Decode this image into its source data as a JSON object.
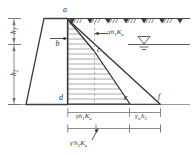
{
  "figure": {
    "type": "engineering-diagram",
    "points": {
      "a": "a",
      "b": "b",
      "c": "c",
      "d": "d",
      "e": "e",
      "f": "f"
    },
    "dimensions": {
      "h1": "h",
      "h1_sub": "1",
      "h2": "h",
      "h2_sub": "2"
    },
    "labels": {
      "active_pressure_top": {
        "gamma": "γ",
        "h": "h",
        "h_sub": "1",
        "K": "K",
        "K_sub": "a"
      },
      "active_pressure_bottom": {
        "gamma": "γ",
        "h": "h",
        "h_sub": "1",
        "K": "K",
        "K_sub": "a"
      },
      "water_pressure": {
        "gamma": "γ",
        "gamma_sub": "w",
        "h": "h",
        "h_sub": "2"
      },
      "submerged_pressure": {
        "gamma": "γ′",
        "h": "h",
        "h_sub": "2",
        "K": "K",
        "K_sub": "a"
      }
    },
    "symbols": {
      "ground_surface": "ground-hatch-icon",
      "water_table": "water-table-icon"
    },
    "colors": {
      "line": "#4a4a4a",
      "hatch": "#8c8c8c",
      "text": "#2e2e2e",
      "baseline": "#b4b4b4"
    }
  }
}
